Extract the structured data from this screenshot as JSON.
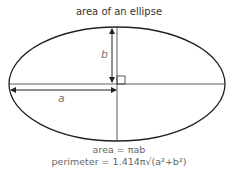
{
  "title": "area of an ellipse",
  "labels": {
    "semi_major": "a",
    "semi_minor": "b"
  },
  "formulas": {
    "area": "area = πab",
    "perimeter": "perimeter = 1.414π√(a²+b²)"
  },
  "colors": {
    "stroke": "#222222",
    "label": "#777777",
    "text": "#555555"
  }
}
